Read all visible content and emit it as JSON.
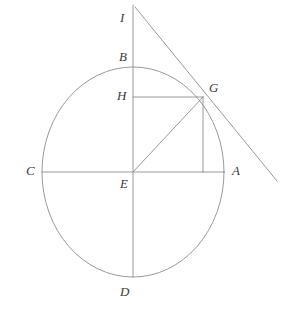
{
  "figure": {
    "kind": "geometry-diagram",
    "background_color": "#ffffff",
    "stroke_color": "#808080",
    "label_color": "#3a3a3a",
    "stroke_width": 0.8,
    "canvas": {
      "width": 290,
      "height": 312
    }
  },
  "circle": {
    "name": "main-circle",
    "center": {
      "x": 133,
      "y": 172
    },
    "radius_x": 91,
    "radius_y": 105
  },
  "points": [
    {
      "id": "I",
      "label": "I",
      "x": 133,
      "y": 5,
      "label_x": 120,
      "label_y": 11,
      "desc": "top of vertical line, apex of tangent"
    },
    {
      "id": "B",
      "label": "B",
      "x": 133,
      "y": 67,
      "label_x": 119,
      "label_y": 50,
      "desc": "top of circle"
    },
    {
      "id": "H",
      "label": "H",
      "x": 133,
      "y": 97,
      "label_x": 117,
      "label_y": 89,
      "desc": "foot of perpendicular from G to BD"
    },
    {
      "id": "G",
      "label": "G",
      "x": 203,
      "y": 97,
      "label_x": 209,
      "label_y": 81,
      "desc": "point on circle, tangency point"
    },
    {
      "id": "C",
      "label": "C",
      "x": 42,
      "y": 172,
      "label_x": 26,
      "label_y": 164,
      "desc": "left of circle"
    },
    {
      "id": "E",
      "label": "E",
      "x": 133,
      "y": 172,
      "label_x": 120,
      "label_y": 177,
      "desc": "center of circle"
    },
    {
      "id": "A",
      "label": "A",
      "x": 224,
      "y": 172,
      "label_x": 232,
      "label_y": 164,
      "desc": "right of circle"
    },
    {
      "id": "D",
      "label": "D",
      "x": 133,
      "y": 277,
      "label_x": 120,
      "label_y": 285,
      "desc": "bottom of circle"
    }
  ],
  "segments": [
    {
      "name": "segment-ID-vertical",
      "from": {
        "x": 133,
        "y": 5
      },
      "to": {
        "x": 133,
        "y": 277
      }
    },
    {
      "name": "segment-CA-horizontal",
      "from": {
        "x": 42,
        "y": 172
      },
      "to": {
        "x": 224,
        "y": 172
      }
    },
    {
      "name": "segment-HG",
      "from": {
        "x": 133,
        "y": 97
      },
      "to": {
        "x": 203,
        "y": 97
      }
    },
    {
      "name": "segment-EG-radius",
      "from": {
        "x": 133,
        "y": 172
      },
      "to": {
        "x": 203,
        "y": 97
      }
    },
    {
      "name": "segment-G-foot-vertical",
      "from": {
        "x": 203,
        "y": 97
      },
      "to": {
        "x": 203,
        "y": 172
      }
    },
    {
      "name": "segment-IG-tangent",
      "from": {
        "x": 135,
        "y": 7
      },
      "to": {
        "x": 277,
        "y": 181
      }
    }
  ],
  "labels_order": [
    "I",
    "B",
    "H",
    "G",
    "C",
    "E",
    "A",
    "D"
  ]
}
